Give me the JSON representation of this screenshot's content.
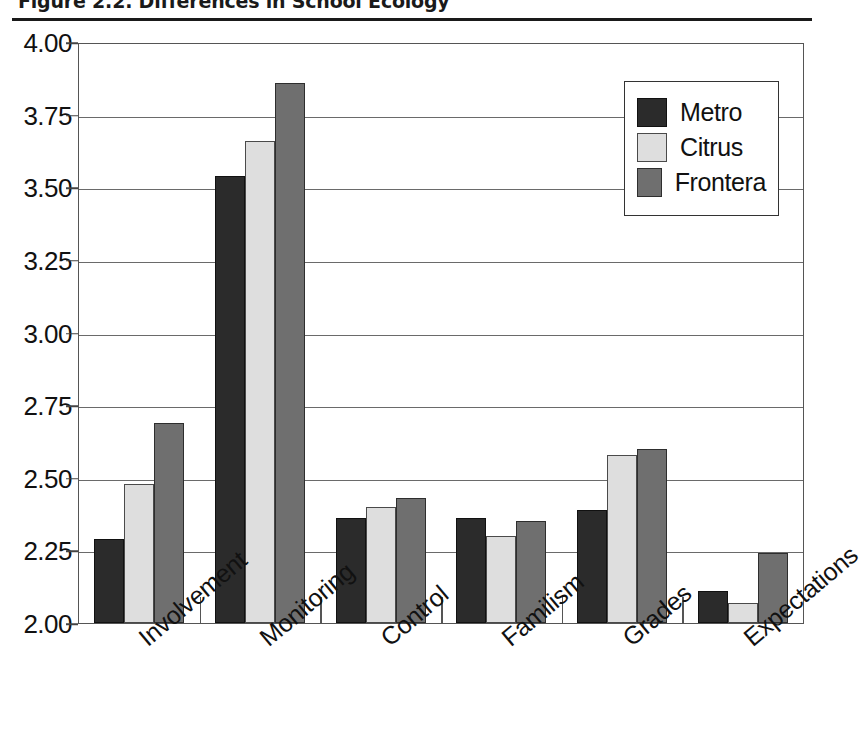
{
  "figure": {
    "title": "Figure 2.2. Differences in School Ecology"
  },
  "chart_data": {
    "type": "bar",
    "title": "Figure 2.2. Differences in School Ecology",
    "xlabel": "",
    "ylabel": "",
    "ylim": [
      2.0,
      4.0
    ],
    "ytick_step": 0.25,
    "grid": true,
    "legend_position": "top-right",
    "categories": [
      "Involvement",
      "Monitoring",
      "Control",
      "Familism",
      "Grades",
      "Expectations"
    ],
    "ytick_labels": [
      "2.00",
      "2.25",
      "2.50",
      "2.75",
      "3.00",
      "3.25",
      "3.50",
      "3.75",
      "4.00"
    ],
    "ytick_values": [
      2.0,
      2.25,
      2.5,
      2.75,
      3.0,
      3.25,
      3.5,
      3.75,
      4.0
    ],
    "series": [
      {
        "name": "Metro",
        "color": "#2b2b2b",
        "values": [
          2.29,
          3.54,
          2.36,
          2.36,
          2.39,
          2.11
        ]
      },
      {
        "name": "Citrus",
        "color": "#dedede",
        "values": [
          2.48,
          3.66,
          2.4,
          2.3,
          2.58,
          2.07
        ]
      },
      {
        "name": "Frontera",
        "color": "#6f6f6f",
        "values": [
          2.69,
          3.86,
          2.43,
          2.35,
          2.6,
          2.24
        ]
      }
    ]
  },
  "legend": {
    "entries": [
      {
        "label": "Metro"
      },
      {
        "label": "Citrus"
      },
      {
        "label": "Frontera"
      }
    ]
  }
}
